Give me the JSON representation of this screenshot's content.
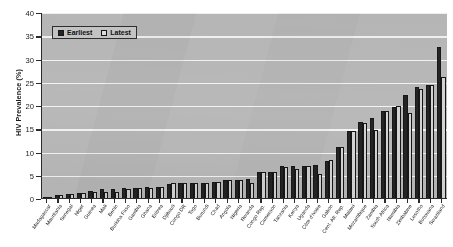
{
  "chart_data": {
    "type": "bar",
    "title": "",
    "xlabel": "",
    "ylabel": "HIV Prevalence (%)",
    "ylim": [
      0,
      40
    ],
    "yticks": [
      0,
      5,
      10,
      15,
      20,
      25,
      30,
      35,
      40
    ],
    "grid": true,
    "legend_position": "top-left",
    "categories": [
      "Madagascar",
      "Mauritania",
      "Senegal",
      "Niger",
      "Guinea",
      "Mali",
      "Benin",
      "Burkina Faso",
      "Gambia",
      "Ghana",
      "Eritrea",
      "Djibouti",
      "Congo DR",
      "Togo",
      "Burundi",
      "Chad",
      "Angola",
      "Nigeria",
      "Rwanda",
      "Congo Rep.",
      "Cameroon",
      "Tanzania",
      "Kenya",
      "Uganda",
      "Côte d'Ivoire",
      "Gabon",
      "Cent. Afr. Rep.",
      "Malawi",
      "Mozambique",
      "Zambia",
      "South Africa",
      "Namibia",
      "Zimbabwe",
      "Lesotho",
      "Botswana",
      "Swaziland"
    ],
    "series": [
      {
        "name": "Earliest",
        "color": "#242424",
        "values": [
          0.3,
          0.7,
          0.9,
          1.1,
          1.5,
          1.9,
          2.0,
          2.1,
          2.2,
          2.3,
          2.4,
          3.1,
          3.2,
          3.3,
          3.3,
          3.5,
          3.8,
          3.9,
          4.0,
          5.5,
          5.7,
          6.8,
          6.9,
          6.9,
          7.2,
          8.0,
          11.0,
          14.4,
          16.3,
          17.2,
          18.8,
          19.6,
          22.2,
          23.9,
          24.3,
          32.5
        ]
      },
      {
        "name": "Latest",
        "color": "#d4d4d4",
        "values": [
          0.2,
          0.6,
          0.8,
          1.0,
          1.3,
          1.3,
          1.2,
          1.9,
          2.1,
          2.2,
          2.3,
          3.2,
          3.3,
          3.3,
          3.3,
          3.5,
          3.8,
          3.9,
          3.3,
          5.5,
          5.6,
          6.7,
          6.2,
          6.9,
          5.1,
          8.2,
          10.9,
          14.5,
          16.1,
          14.6,
          18.8,
          19.8,
          18.2,
          23.5,
          24.2,
          26.1
        ]
      }
    ]
  },
  "legend": {
    "items": [
      {
        "label": "Earliest",
        "color": "#242424"
      },
      {
        "label": "Latest",
        "color": "#d4d4d4"
      }
    ]
  },
  "axes": {
    "y_title": "HIV Prevalence (%)",
    "y_tick_labels": [
      "40",
      "35",
      "30",
      "25",
      "20",
      "15",
      "10",
      "5",
      "0"
    ]
  },
  "colors": {
    "plot_background": "#b9b9b9",
    "gridline": "#f3f3f3",
    "axis": "#2b2b2b",
    "earliest": "#242424",
    "latest": "#d4d4d4"
  }
}
